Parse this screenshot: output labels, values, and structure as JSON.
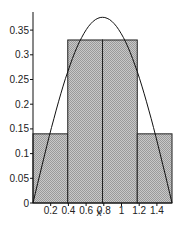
{
  "chart_data": {
    "type": "bar",
    "title": "",
    "xlabel": "x",
    "ylabel": "",
    "xlim": [
      0,
      1.5708
    ],
    "ylim": [
      0,
      0.37
    ],
    "grid": false,
    "legend": null,
    "bars": [
      {
        "x0": 0.0,
        "x1": 0.3927,
        "height": 0.14
      },
      {
        "x0": 0.3927,
        "x1": 0.7854,
        "height": 0.33
      },
      {
        "x0": 0.7854,
        "x1": 1.1781,
        "height": 0.33
      },
      {
        "x0": 1.1781,
        "x1": 1.5708,
        "height": 0.14
      }
    ],
    "curve": {
      "type": "line",
      "description": "smooth hump curve over bars",
      "x": [
        0,
        0.2,
        0.4,
        0.6,
        0.7854,
        1.0,
        1.2,
        1.4,
        1.5708
      ],
      "y": [
        0.0,
        0.146,
        0.27,
        0.35,
        0.376,
        0.35,
        0.253,
        0.121,
        0.0
      ]
    },
    "x_ticks": [
      "0.2",
      "0.4",
      "0.6",
      "0.8",
      "1",
      "1.2",
      "1.4"
    ],
    "x_tick_values": [
      0.2,
      0.4,
      0.6,
      0.8,
      1.0,
      1.2,
      1.4
    ],
    "y_ticks": [
      "0",
      "0.05",
      "0.1",
      "0.15",
      "0.2",
      "0.25",
      "0.3",
      "0.35"
    ],
    "y_tick_values": [
      0,
      0.05,
      0.1,
      0.15,
      0.2,
      0.25,
      0.3,
      0.35
    ]
  }
}
